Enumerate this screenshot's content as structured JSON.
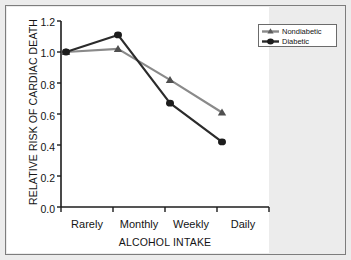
{
  "chart_data": {
    "type": "line",
    "title": "",
    "xlabel": "ALCOHOL INTAKE",
    "ylabel": "RELATIVE RISK OF CARDIAC DEATH",
    "categories": [
      "Rarely",
      "Monthly",
      "Weekly",
      "Daily"
    ],
    "ylim": [
      0.0,
      1.2
    ],
    "yticks": [
      "0.0",
      "0.2",
      "0.4",
      "0.6",
      "0.8",
      "1.0",
      "1.2"
    ],
    "ytick_values": [
      0.0,
      0.2,
      0.4,
      0.6,
      0.8,
      1.0,
      1.2
    ],
    "grid": false,
    "legend_position": "top-right",
    "series": [
      {
        "name": "Nondiabetic",
        "marker": "triangle",
        "color": "#8a8a8a",
        "values": [
          1.0,
          1.02,
          0.82,
          0.61
        ]
      },
      {
        "name": "Diabetic",
        "marker": "circle",
        "color": "#2b2b2b",
        "values": [
          1.0,
          1.11,
          0.67,
          0.42
        ]
      }
    ]
  },
  "legend": {
    "entries": [
      {
        "label": "Nondiabetic"
      },
      {
        "label": "Diabetic"
      }
    ]
  },
  "axes": {
    "x_title": "ALCOHOL INTAKE",
    "y_title": "RELATIVE RISK OF CARDIAC DEATH"
  },
  "colors": {
    "nondiabetic": "#8a8a8a",
    "diabetic": "#2b2b2b",
    "axis": "#1c1c1c",
    "page_background": "#ececec",
    "plot_background": "#ffffff",
    "frame_border": "#7d7d7d"
  }
}
